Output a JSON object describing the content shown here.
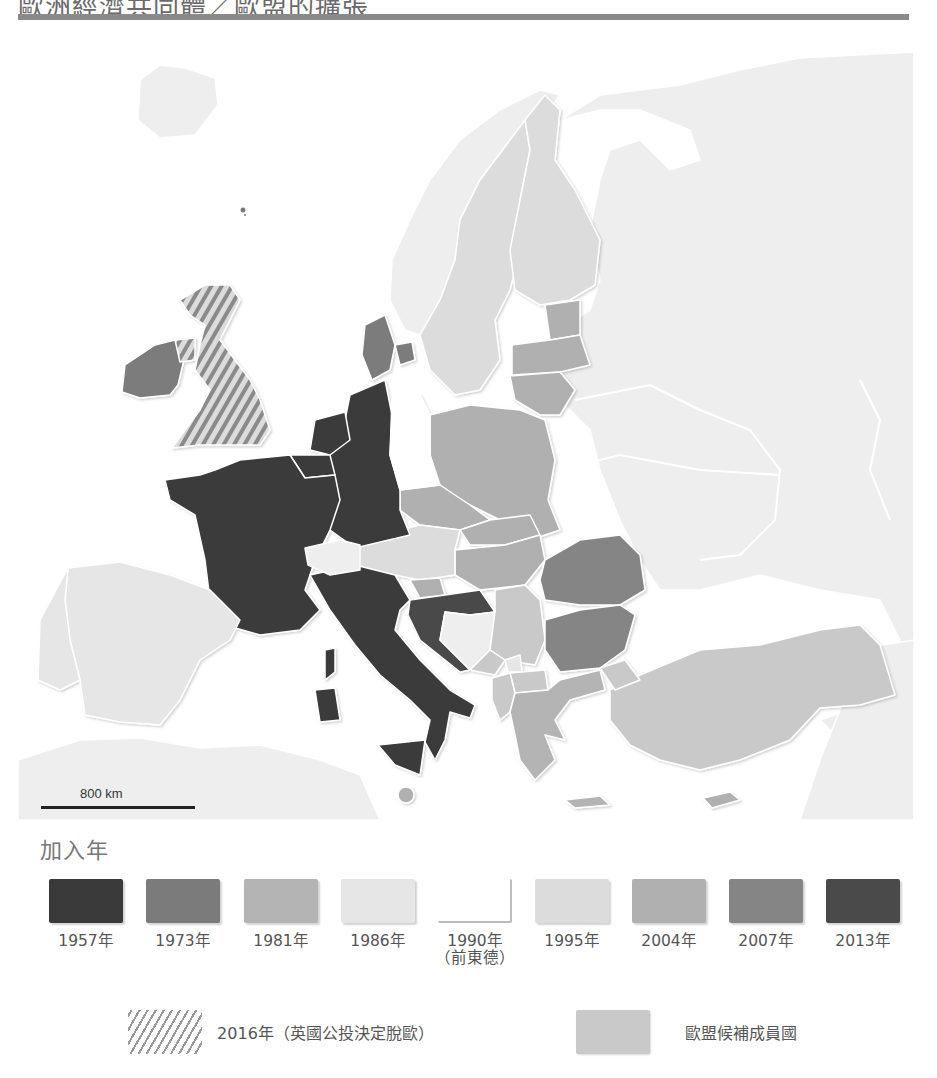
{
  "header": {
    "title": "歐洲經濟共同體／歐盟的擴張"
  },
  "map": {
    "scale_label": "800 km",
    "colors": {
      "sea": "#ffffff",
      "non_member": "#eeeeee",
      "y1957": "#3a3a3a",
      "y1973": "#7b7b7b",
      "y1981": "#b4b4b4",
      "y1986": "#e6e6e6",
      "y1990": "#ffffff",
      "y1995": "#dcdcdc",
      "y2004": "#b0b0b0",
      "y2007": "#858585",
      "y2013": "#4a4a4a",
      "candidate": "#c9c9c9",
      "border": "#ffffff"
    }
  },
  "legend": {
    "title": "加入年",
    "items": [
      {
        "year": "1957年",
        "sub": "",
        "color": "#3a3a3a"
      },
      {
        "year": "1973年",
        "sub": "",
        "color": "#7b7b7b"
      },
      {
        "year": "1981年",
        "sub": "",
        "color": "#b4b4b4"
      },
      {
        "year": "1986年",
        "sub": "",
        "color": "#e6e6e6"
      },
      {
        "year": "1990年",
        "sub": "（前東德）",
        "color": "#ffffff"
      },
      {
        "year": "1995年",
        "sub": "",
        "color": "#dcdcdc"
      },
      {
        "year": "2004年",
        "sub": "",
        "color": "#b0b0b0"
      },
      {
        "year": "2007年",
        "sub": "",
        "color": "#858585"
      },
      {
        "year": "2013年",
        "sub": "",
        "color": "#4a4a4a"
      }
    ],
    "brexit_label": "2016年（英國公投決定脫歐）",
    "candidate_label": "歐盟候補成員國"
  }
}
